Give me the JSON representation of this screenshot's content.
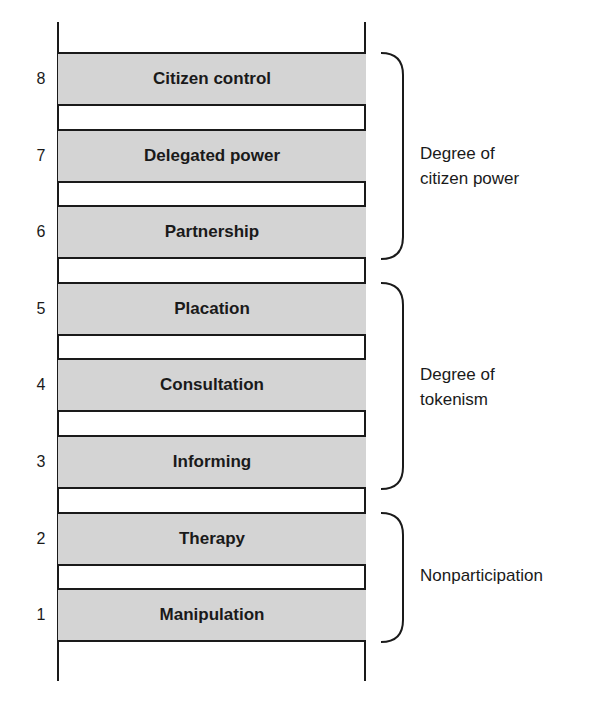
{
  "ladder": {
    "rungs": [
      {
        "number": "8",
        "label": "Citizen control"
      },
      {
        "number": "7",
        "label": "Delegated power"
      },
      {
        "number": "6",
        "label": "Partnership"
      },
      {
        "number": "5",
        "label": "Placation"
      },
      {
        "number": "4",
        "label": "Consultation"
      },
      {
        "number": "3",
        "label": "Informing"
      },
      {
        "number": "2",
        "label": "Therapy"
      },
      {
        "number": "1",
        "label": "Manipulation"
      }
    ],
    "groups": [
      {
        "line1": "Degree of",
        "line2": "citizen power",
        "rungs": "6-8"
      },
      {
        "line1": "Degree of",
        "line2": "tokenism",
        "rungs": "3-5"
      },
      {
        "line1": "Nonparticipation",
        "line2": "",
        "rungs": "1-2"
      }
    ]
  },
  "colors": {
    "rung_fill": "#d4d4d4",
    "line": "#1a1a1a",
    "background": "#ffffff"
  }
}
